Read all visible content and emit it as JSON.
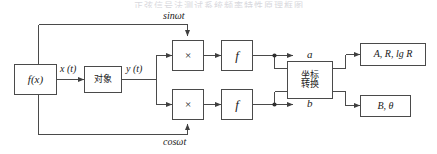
{
  "figure": {
    "top_caption_partial": "正弦信号法测试系统频率特性原理框图",
    "type": "block-diagram"
  },
  "blocks": {
    "signal_source": {
      "label": "f(x)",
      "style": "italic"
    },
    "plant": {
      "label": "对象",
      "style": "cjk"
    },
    "multiplier_top": {
      "label": "×",
      "style": "symbol"
    },
    "multiplier_bottom": {
      "label": "×",
      "style": "symbol"
    },
    "integrator_top": {
      "label": "f",
      "style": "italic"
    },
    "integrator_bottom": {
      "label": "f",
      "style": "italic"
    },
    "coordinate_transform": {
      "line1": "坐标",
      "line2": "转换",
      "style": "cjk"
    },
    "output_amplitude": {
      "label": "A, R, lg R",
      "style": "italic"
    },
    "output_phase": {
      "label": "B, θ",
      "style": "italic"
    }
  },
  "signals": {
    "x_t": "x (t)",
    "y_t": "y (t)",
    "sin_wt": "sinωt",
    "cos_wt": "cosωt",
    "a": "a",
    "b": "b"
  },
  "colors": {
    "line": "#4a4a4a",
    "text": "#1a1a1a",
    "background": "#ffffff"
  }
}
